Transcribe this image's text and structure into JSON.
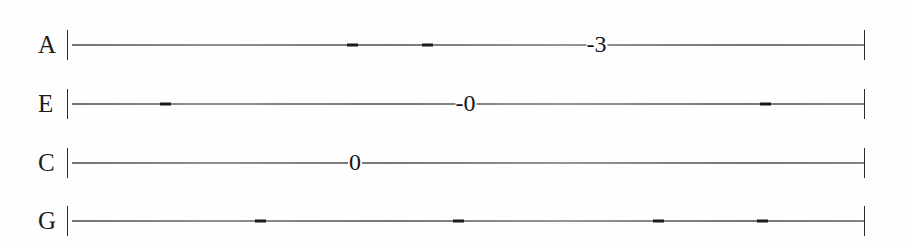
{
  "document": {
    "kind": "guitar-tablature",
    "title": "",
    "background_color": "#fefefe",
    "ink_color": "#1a1a1a",
    "line_color": "#5a5a5a",
    "string_count": 4
  },
  "tab": {
    "strings": [
      {
        "id": "string-a",
        "label": "A",
        "line_y": 45,
        "barline_start": "|",
        "barline_end": "|",
        "notes": [
          {
            "text": "-3",
            "x": 597,
            "has_leading_dash": true
          }
        ],
        "dashes": [
          {
            "x": 352
          },
          {
            "x": 427
          }
        ]
      },
      {
        "id": "string-e",
        "label": "E",
        "line_y": 104,
        "barline_start": "|",
        "barline_end": "|",
        "notes": [
          {
            "text": "-0",
            "x": 466,
            "has_leading_dash": true
          }
        ],
        "dashes": [
          {
            "x": 165
          },
          {
            "x": 765
          }
        ]
      },
      {
        "id": "string-c",
        "label": "C",
        "line_y": 163,
        "barline_start": "|",
        "barline_end": "|",
        "notes": [
          {
            "text": "0",
            "x": 355,
            "has_leading_dash": false
          }
        ],
        "dashes": []
      },
      {
        "id": "string-g",
        "label": "G",
        "line_y": 221,
        "barline_start": "|",
        "barline_end": "|",
        "notes": [],
        "dashes": [
          {
            "x": 260
          },
          {
            "x": 458
          },
          {
            "x": 658
          },
          {
            "x": 762
          }
        ]
      }
    ]
  }
}
